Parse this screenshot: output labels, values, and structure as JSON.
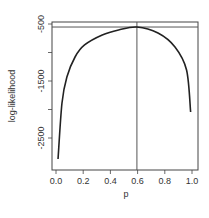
{
  "chart_data": {
    "type": "line",
    "title": "",
    "xlabel": "p",
    "ylabel": "log-likelihood",
    "xlim": [
      0,
      1
    ],
    "ylim": [
      -3050,
      -450
    ],
    "grid": false,
    "legend": "none",
    "x_ticks": [
      {
        "value": 0.0,
        "label": "0.0"
      },
      {
        "value": 0.2,
        "label": "0.2"
      },
      {
        "value": 0.4,
        "label": "0.4"
      },
      {
        "value": 0.6,
        "label": "0.6"
      },
      {
        "value": 0.8,
        "label": "0.8"
      },
      {
        "value": 1.0,
        "label": "1.0"
      }
    ],
    "y_ticks": [
      {
        "value": -500,
        "label": "-500"
      },
      {
        "value": -1000,
        "label": ""
      },
      {
        "value": -1500,
        "label": "-1500"
      },
      {
        "value": -2000,
        "label": ""
      },
      {
        "value": -2500,
        "label": "-2500"
      }
    ],
    "series": [
      {
        "name": "log-likelihood",
        "color": "#222222",
        "x": [
          0.015,
          0.044,
          0.08,
          0.14,
          0.21,
          0.34,
          0.46,
          0.595,
          0.75,
          0.875,
          0.96,
          0.99
        ],
        "y": [
          -2869,
          -1886,
          -1430,
          -1079,
          -868,
          -693,
          -605,
          -553,
          -658,
          -903,
          -1307,
          -2044
        ]
      }
    ],
    "annotations": [
      {
        "type": "hline",
        "y": -553,
        "color": "#555555"
      },
      {
        "type": "vline",
        "x": 0.595,
        "color": "#555555"
      }
    ],
    "caption_partial": ""
  }
}
